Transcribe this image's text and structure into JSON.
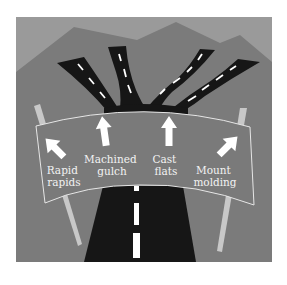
{
  "diagram": {
    "colors": {
      "sky": "#9a9a9a",
      "mountains": "#7b7b7b",
      "road": "#161616",
      "lane_marking": "#ffffff",
      "sign_fill": "#7a7a7a",
      "sign_border": "#e6e6e6",
      "post": "#c8c8c8",
      "arrow": "#ffffff",
      "label_text": "#f2f2f2"
    },
    "destinations": [
      {
        "id": "rapid-rapids",
        "line1": "Rapid",
        "line2": "rapids",
        "arrow_direction": "up-left"
      },
      {
        "id": "machined-gulch",
        "line1": "Machined",
        "line2": "gulch",
        "arrow_direction": "up"
      },
      {
        "id": "cast-flats",
        "line1": "Cast",
        "line2": "flats",
        "arrow_direction": "up"
      },
      {
        "id": "mount-molding",
        "line1": "Mount",
        "line2": "molding",
        "arrow_direction": "up-right"
      }
    ],
    "road_branches": 4
  }
}
